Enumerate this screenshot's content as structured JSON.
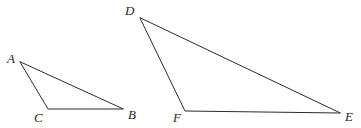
{
  "figure": {
    "background_color": "#ffffff",
    "stroke_color": "#2b2b2b",
    "label_color": "#1f1f1f",
    "width": 361,
    "height": 128
  },
  "triangles": [
    {
      "id": "triangle-abc",
      "name": "Triangle ABC",
      "vertices": [
        {
          "label": "A",
          "x": 20,
          "y": 62,
          "label_x": 7,
          "label_y": 52
        },
        {
          "label": "C",
          "x": 48,
          "y": 109,
          "label_x": 34,
          "label_y": 111
        },
        {
          "label": "B",
          "x": 123,
          "y": 109,
          "label_x": 128,
          "label_y": 108
        }
      ],
      "path": "M 20 62 L 48 109 L 123 109 Z"
    },
    {
      "id": "triangle-def",
      "name": "Triangle DEF",
      "vertices": [
        {
          "label": "D",
          "x": 140,
          "y": 18,
          "label_x": 125,
          "label_y": 4
        },
        {
          "label": "F",
          "x": 185,
          "y": 111,
          "label_x": 173,
          "label_y": 111
        },
        {
          "label": "E",
          "x": 340,
          "y": 113,
          "label_x": 345,
          "label_y": 110
        }
      ],
      "path": "M 140 18 L 185 111 L 340 113 Z"
    }
  ]
}
